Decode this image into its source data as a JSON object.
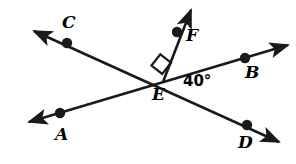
{
  "figure": {
    "background_color": "#ffffff",
    "stroke_color": "#1a1a1a",
    "width": 296,
    "height": 164
  },
  "points": [
    {
      "id": "C",
      "label": "C",
      "dot_x": 67,
      "dot_y": 43,
      "label_x": 62,
      "label_y": 14
    },
    {
      "id": "F",
      "label": "F",
      "dot_x": 177,
      "dot_y": 32,
      "label_x": 186,
      "label_y": 27
    },
    {
      "id": "B",
      "label": "B",
      "dot_x": 245,
      "dot_y": 58,
      "label_x": 245,
      "label_y": 64
    },
    {
      "id": "A",
      "label": "A",
      "dot_x": 60,
      "dot_y": 113,
      "label_x": 55,
      "label_y": 126
    },
    {
      "id": "D",
      "label": "D",
      "dot_x": 247,
      "dot_y": 125,
      "label_x": 238,
      "label_y": 134
    },
    {
      "id": "E",
      "label": "E",
      "dot_x": 163,
      "dot_y": 82,
      "label_x": 152,
      "label_y": 86
    }
  ],
  "vertex": {
    "id": "E",
    "x": 163,
    "y": 82
  },
  "lines": [
    {
      "id": "line-CD",
      "name": "line-c-d",
      "from": {
        "x": 34,
        "y": 31
      },
      "to": {
        "x": 279,
        "y": 142
      },
      "arrow_start": true,
      "arrow_end": true
    },
    {
      "id": "line-AB",
      "name": "line-a-b",
      "from": {
        "x": 29,
        "y": 122
      },
      "to": {
        "x": 288,
        "y": 45
      },
      "arrow_start": true,
      "arrow_end": true
    },
    {
      "id": "ray-EF",
      "name": "ray-e-f",
      "from": {
        "x": 163,
        "y": 82
      },
      "to": {
        "x": 191,
        "y": 10
      },
      "arrow_start": false,
      "arrow_end": true
    }
  ],
  "angles": [
    {
      "id": "angle-BED",
      "label": "40°",
      "value": 40,
      "unit": "degrees",
      "label_x": 183,
      "label_y": 74,
      "between": [
        "EB",
        "ED"
      ]
    },
    {
      "id": "angle-FEC",
      "label": "",
      "value": 90,
      "unit": "degrees",
      "marker": "right-angle-square",
      "between": [
        "EF",
        "EC"
      ]
    }
  ],
  "right_angle_marker": {
    "points": "151.5,65.5 160.3,54.3 171.0,62.7 163,82"
  }
}
